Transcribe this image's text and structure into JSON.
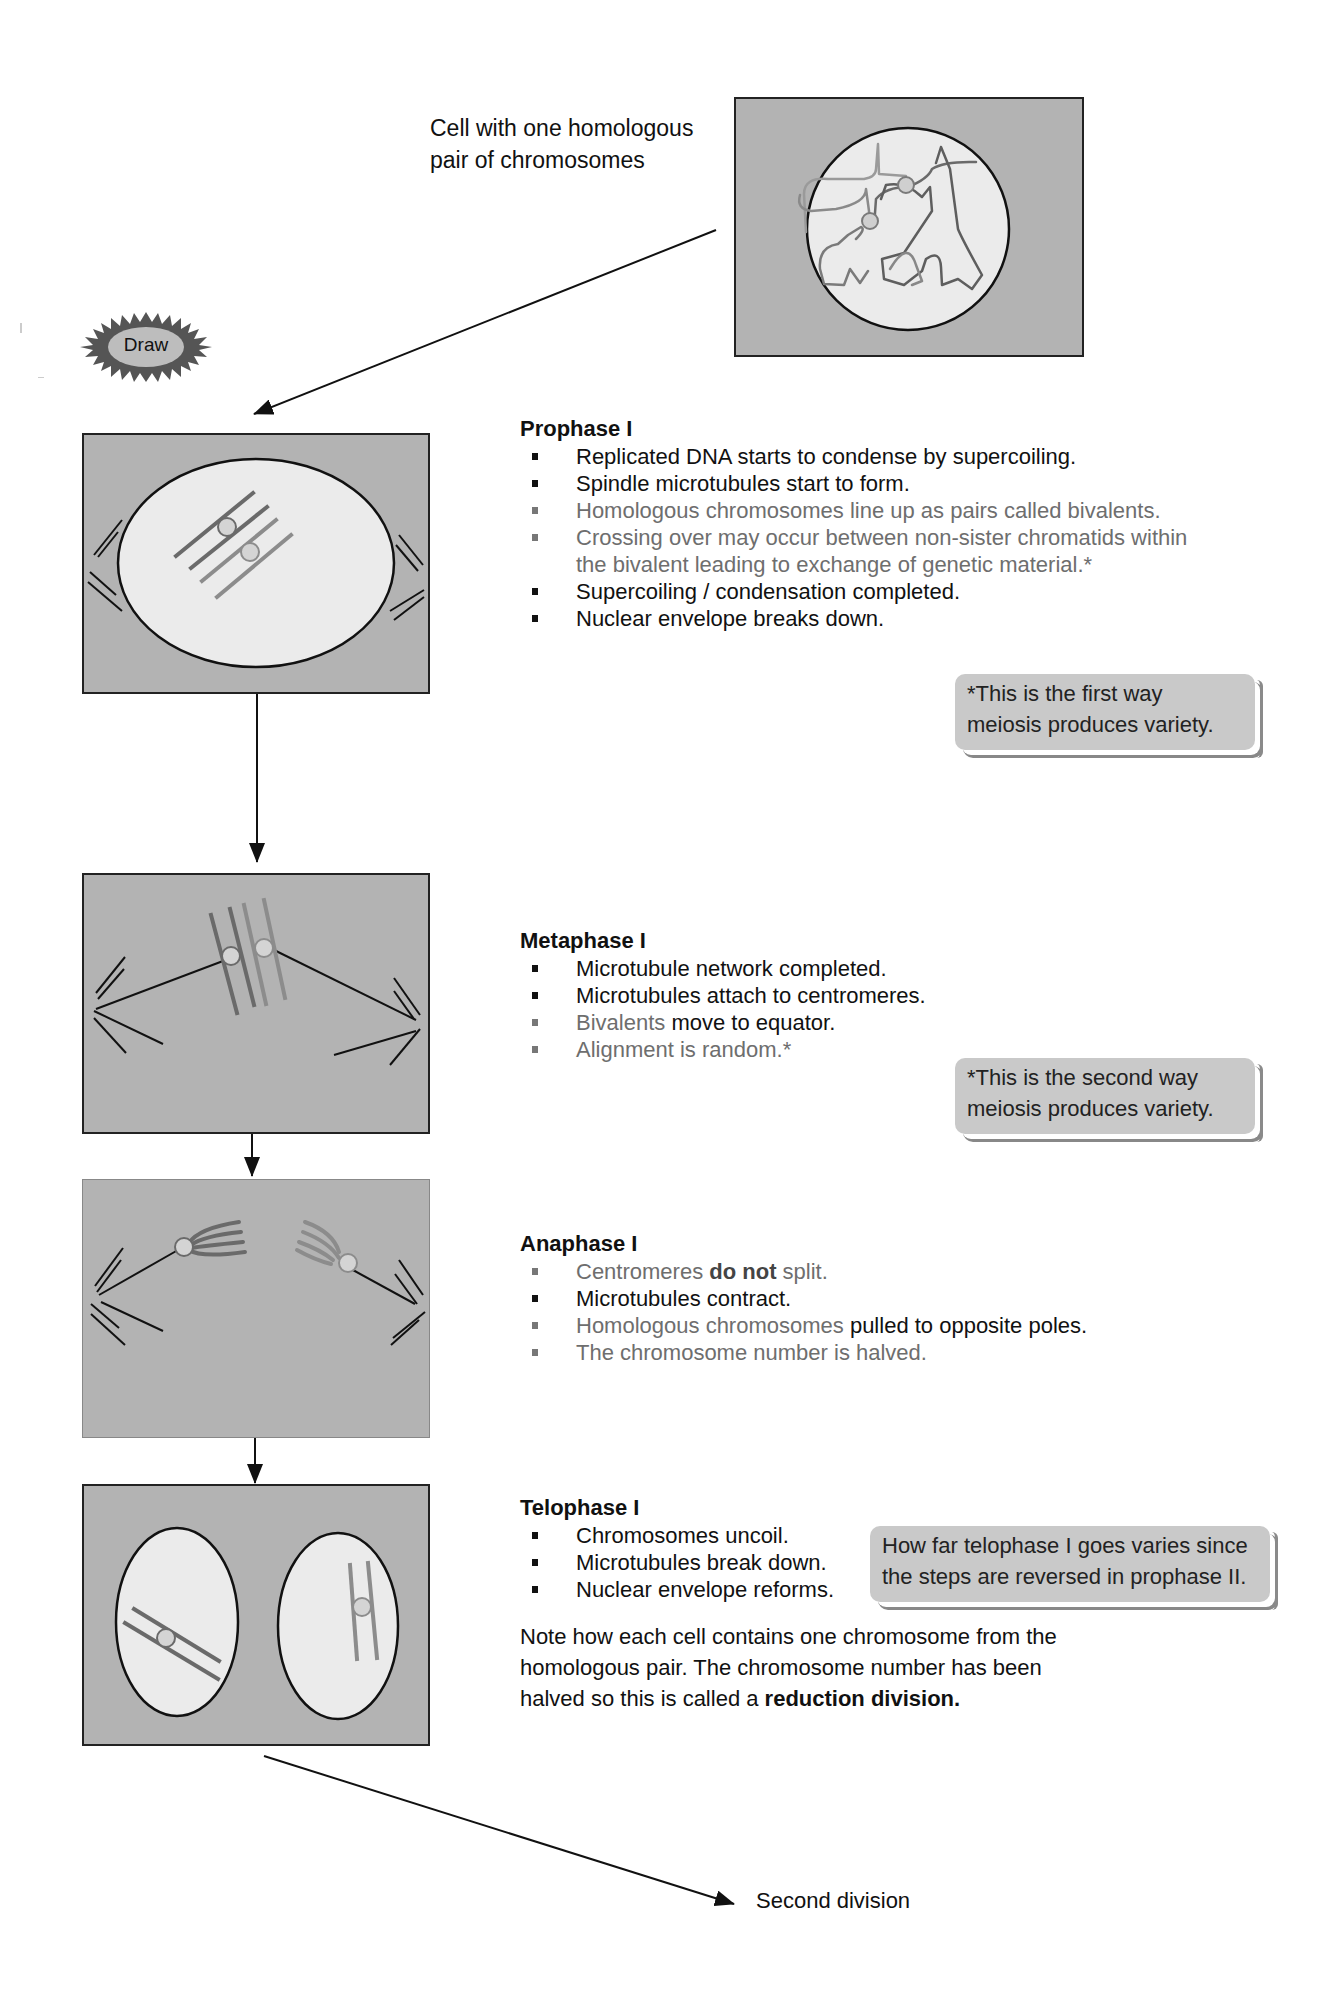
{
  "intro": {
    "caption_line1": "Cell with one homologous",
    "caption_line2": "pair of chromosomes"
  },
  "badge": {
    "label": "Draw",
    "icon": "starburst-icon"
  },
  "phases": [
    {
      "title": "Prophase I",
      "items": [
        {
          "text": "Replicated DNA starts to condense by supercoiling.",
          "style": "dark"
        },
        {
          "text": "Spindle microtubules start to form.",
          "style": "dark"
        },
        {
          "text": "Homologous chromosomes line up as pairs called bivalents.",
          "style": "muted"
        },
        {
          "text": "Crossing over may occur between non-sister chromatids within the bivalent leading to exchange of genetic material.*",
          "style": "muted"
        },
        {
          "text": "Supercoiling / condensation completed.",
          "style": "dark"
        },
        {
          "text": "Nuclear envelope breaks down.",
          "style": "dark"
        }
      ],
      "note": {
        "line1": "*This is the first way",
        "line2": "meiosis produces variety."
      }
    },
    {
      "title": "Metaphase I",
      "items": [
        {
          "text": "Microtubule network completed.",
          "style": "dark"
        },
        {
          "text": "Microtubules attach to centromeres.",
          "style": "dark"
        },
        {
          "muted_part": "Bivalents",
          "dark_part": " move to equator.",
          "style": "mixed"
        },
        {
          "text": "Alignment is random.*",
          "style": "muted"
        }
      ],
      "note": {
        "line1": "*This is the second way",
        "line2": "meiosis produces variety."
      }
    },
    {
      "title": "Anaphase I",
      "items": [
        {
          "pre": "Centromeres ",
          "bold": "do not",
          "post": " split.",
          "style": "muted"
        },
        {
          "text": "Microtubules contract.",
          "style": "dark"
        },
        {
          "muted_part": "Homologous chromosomes",
          "dark_part": " pulled to opposite poles.",
          "style": "mixed"
        },
        {
          "text": "The chromosome number is halved.",
          "style": "muted"
        }
      ]
    },
    {
      "title": "Telophase I",
      "items": [
        {
          "text": "Chromosomes uncoil.",
          "style": "dark"
        },
        {
          "text": "Microtubules break down.",
          "style": "dark"
        },
        {
          "text": "Nuclear envelope reforms.",
          "style": "dark"
        }
      ],
      "note": {
        "line1": "How far telophase I goes varies since",
        "line2": "the steps are reversed in prophase II."
      },
      "paragraph": {
        "line1": "Note how each cell contains one chromosome from the",
        "line2": "homologous pair. The chromosome number has been",
        "line3_pre": "halved so this is called a ",
        "line3_bold": "reduction division."
      }
    }
  ],
  "footer": {
    "next_label": "Second division"
  },
  "colors": {
    "cell_bg": "#b3b3b3",
    "nucleus_fill": "#ebebeb",
    "chromosome_dark": "#6a6a6a",
    "chromosome_light": "#8c8c8c",
    "centromere_fill": "#d4d4d4",
    "note_bg": "#c9c9c9"
  }
}
